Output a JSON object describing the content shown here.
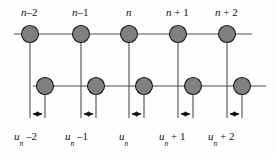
{
  "figure": {
    "type": "lattice-diagram",
    "width": 276,
    "height": 154,
    "background": "#fefefe",
    "atom_fill": "#808080",
    "atom_stroke": "#1a1a1a",
    "line_color": "#4d4d4d",
    "arrow_color": "#111111",
    "text_color": "#121212"
  },
  "rows": {
    "top": {
      "name": "upper-chain",
      "y": 34,
      "line_x_start": 14,
      "line_x_end": 252,
      "atom_radius": 8.5,
      "atom_x": [
        30,
        81,
        129,
        178,
        227
      ]
    },
    "bottom": {
      "name": "lower-chain",
      "y": 86,
      "line_x_start": 33,
      "line_x_end": 266,
      "atom_radius": 8.5,
      "atom_x": [
        45,
        96,
        144,
        193,
        242
      ]
    }
  },
  "guides": {
    "top_verticals_x": [
      30,
      81,
      129,
      178,
      227
    ],
    "top_verticals_y1": 42,
    "top_verticals_y2": 118,
    "bottom_verticals_x": [
      45,
      96,
      144,
      193,
      242
    ],
    "bottom_verticals_y1": 94,
    "bottom_verticals_y2": 118
  },
  "arrows": {
    "y": 114,
    "pairs": [
      {
        "x1": 32,
        "x2": 43
      },
      {
        "x1": 83,
        "x2": 94
      },
      {
        "x1": 131,
        "x2": 142
      },
      {
        "x1": 180,
        "x2": 191
      },
      {
        "x1": 229,
        "x2": 240
      }
    ]
  },
  "top_labels": [
    {
      "name": "label-n-minus-2",
      "base": "n",
      "suffix": "–2",
      "x": 21
    },
    {
      "name": "label-n-minus-1",
      "base": "n",
      "suffix": "–1",
      "x": 72
    },
    {
      "name": "label-n",
      "base": "n",
      "suffix": "",
      "x": 126
    },
    {
      "name": "label-n-plus-1",
      "base": "n",
      "suffix": "+ 1",
      "x": 166
    },
    {
      "name": "label-n-plus-2",
      "base": "n",
      "suffix": "+ 2",
      "x": 215
    }
  ],
  "bottom_labels": [
    {
      "name": "label-u-n-minus-2",
      "base": "u",
      "sub": "n",
      "suffix": "–2",
      "x": 14
    },
    {
      "name": "label-u-n-minus-1",
      "base": "u",
      "sub": "n",
      "suffix": "–1",
      "x": 65
    },
    {
      "name": "label-u-n",
      "base": "u",
      "sub": "n",
      "suffix": "",
      "x": 119
    },
    {
      "name": "label-u-n-plus-1",
      "base": "u",
      "sub": "n",
      "suffix": "+ 1",
      "x": 159
    },
    {
      "name": "label-u-n-plus-2",
      "base": "u",
      "sub": "n",
      "suffix": "+ 2",
      "x": 208
    }
  ]
}
